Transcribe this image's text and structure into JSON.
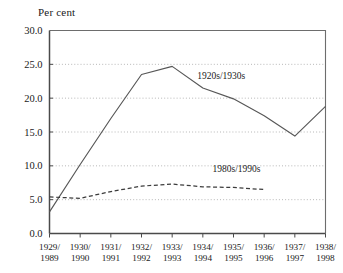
{
  "chart_data": {
    "type": "line",
    "title": "",
    "ylabel": "Per cent",
    "xlabel": "",
    "ylim": [
      0.0,
      30.0
    ],
    "ytick_labels": [
      "0.0",
      "5.0",
      "10.0",
      "15.0",
      "20.0",
      "25.0",
      "30.0"
    ],
    "ytick_values": [
      0.0,
      5.0,
      10.0,
      15.0,
      20.0,
      25.0,
      30.0
    ],
    "grid": "horizontal-dotted",
    "legend_position": "inline-annotation",
    "categories": [
      {
        "top": "1929/",
        "bottom": "1989"
      },
      {
        "top": "1930/",
        "bottom": "1990"
      },
      {
        "top": "1931/",
        "bottom": "1991"
      },
      {
        "top": "1932/",
        "bottom": "1992"
      },
      {
        "top": "1933/",
        "bottom": "1993"
      },
      {
        "top": "1934/",
        "bottom": "1994"
      },
      {
        "top": "1935/",
        "bottom": "1995"
      },
      {
        "top": "1936/",
        "bottom": "1996"
      },
      {
        "top": "1937/",
        "bottom": "1997"
      },
      {
        "top": "1938/",
        "bottom": "1998"
      }
    ],
    "series": [
      {
        "name": "1920s/1930s",
        "style": "solid",
        "color": "#575757",
        "values": [
          3.2,
          10.2,
          17.0,
          23.5,
          24.7,
          21.5,
          19.9,
          17.4,
          14.4,
          18.8
        ]
      },
      {
        "name": "1980s/1990s",
        "style": "dashed",
        "color": "#3c3c3c",
        "values": [
          5.4,
          5.2,
          6.2,
          7.0,
          7.3,
          6.9,
          6.8,
          6.5,
          null,
          null
        ]
      }
    ],
    "annotations": [
      {
        "text": "1920s/1930s",
        "x_category_index": 5.6,
        "value": 22.9
      },
      {
        "text": "1980s/1990s",
        "x_category_index": 6.1,
        "value": 9.1
      }
    ]
  }
}
